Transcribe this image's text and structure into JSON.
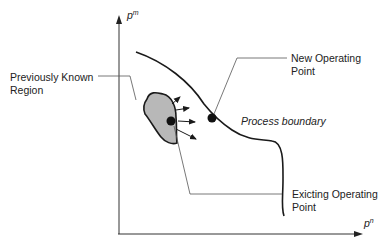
{
  "axes": {
    "y_label": "p",
    "y_sup": "m",
    "x_label": "p",
    "x_sup": "n"
  },
  "labels": {
    "new_point_line1": "New Operating",
    "new_point_line2": "Point",
    "prev_region_line1": "Previously Known",
    "prev_region_line2": "Region",
    "boundary": "Process boundary",
    "existing_line1": "Exicting Operating",
    "existing_line2": "Point"
  },
  "colors": {
    "region_fill": "#b8b8b8",
    "stroke": "#1a1a1a",
    "leader": "#555555"
  }
}
